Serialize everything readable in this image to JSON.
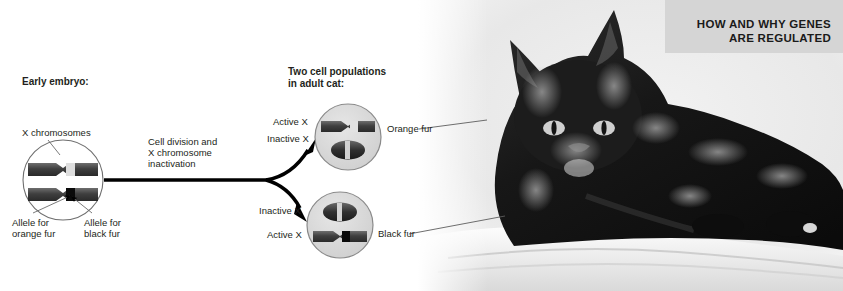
{
  "figure": {
    "title_banner": "HOW AND WHY GENES\nARE REGULATED",
    "banner_bg": "#d5d5d5",
    "background": "#ffffff"
  },
  "stages": {
    "early_embryo": {
      "heading": "Early embryo:",
      "chromosome_label": "X chromosomes",
      "allele_orange": "Allele for\norange fur",
      "allele_black": "Allele for\nblack fur"
    },
    "process_arrow": {
      "label": "Cell division and\nX chromosome\ninactivation"
    },
    "adult": {
      "heading": "Two cell populations\nin adult cat:",
      "cells": [
        {
          "name": "orange-fur-cell",
          "top_label": "Active X",
          "bottom_label": "Inactive X",
          "outcome_label": "Orange fur",
          "active_allele": "orange",
          "barr_body_position": "bottom"
        },
        {
          "name": "black-fur-cell",
          "top_label": "Inactive X",
          "bottom_label": "Active X",
          "outcome_label": "Black fur",
          "active_allele": "black",
          "barr_body_position": "top"
        }
      ]
    }
  },
  "photo": {
    "subject": "tortoiseshell-cat",
    "description": "Black and orange tortoiseshell cat lying on a white fluffy blanket",
    "rendering": "grayscale-photograph"
  },
  "colors": {
    "chromosome_body": "#4a4a4a",
    "chromosome_dark_band": "#111111",
    "chromosome_light_band": "#d8d8d8",
    "cell_fill": "#d9d9d9",
    "cell_stroke": "#8a8a8a",
    "arrow": "#000000",
    "leader_line": "#6b6b6b",
    "text": "#231f20"
  }
}
